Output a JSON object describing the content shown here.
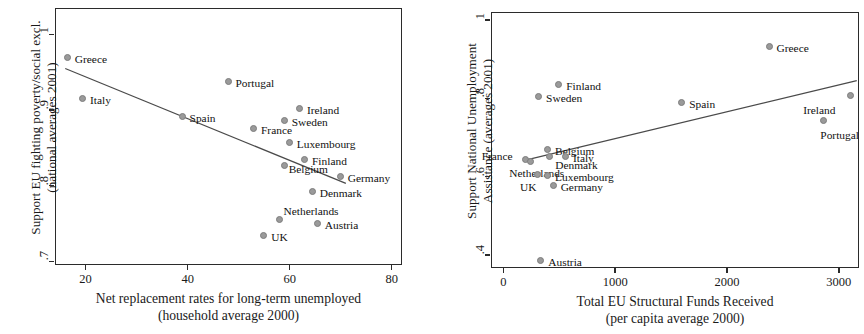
{
  "chart_data": [
    {
      "type": "scatter",
      "panel": "left",
      "title": "",
      "xlabel": "Net replacement rates for long-term unemployed",
      "xlabel2": "(household average 2000)",
      "ylabel": "Support EU fighting poverty/social excl.",
      "ylabel2": "(national averages 2001)",
      "xlim": [
        14,
        82
      ],
      "ylim": [
        0.695,
        1.035
      ],
      "xticks": [
        20,
        40,
        60,
        80
      ],
      "xticklabels": [
        "20",
        "40",
        "60",
        "80"
      ],
      "yticks": [
        0.7,
        0.8,
        0.9,
        1.0
      ],
      "yticklabels": [
        ".7",
        ".8",
        ".9",
        "1"
      ],
      "grid": false,
      "legend": "none",
      "point_labels_shown": true,
      "points": [
        {
          "label": "Greece",
          "x": 16.5,
          "y": 0.969,
          "lx": 7,
          "ly": -4
        },
        {
          "label": "Italy",
          "x": 19.5,
          "y": 0.915,
          "lx": 7,
          "ly": -4
        },
        {
          "label": "Spain",
          "x": 39.0,
          "y": 0.891,
          "lx": 7,
          "ly": -4
        },
        {
          "label": "Portugal",
          "x": 48.0,
          "y": 0.937,
          "lx": 7,
          "ly": -4
        },
        {
          "label": "France",
          "x": 53.0,
          "y": 0.875,
          "lx": 7,
          "ly": -4
        },
        {
          "label": "UK",
          "x": 55.0,
          "y": 0.733,
          "lx": 7,
          "ly": -4
        },
        {
          "label": "Netherlands",
          "x": 58.0,
          "y": 0.755,
          "lx": 4,
          "ly": -14
        },
        {
          "label": "Sweden",
          "x": 59.0,
          "y": 0.885,
          "lx": 7,
          "ly": -4
        },
        {
          "label": "Belgium",
          "x": 59.0,
          "y": 0.826,
          "lx": 4,
          "ly": -2
        },
        {
          "label": "Luxembourg",
          "x": 60.0,
          "y": 0.857,
          "lx": 7,
          "ly": -4
        },
        {
          "label": "Ireland",
          "x": 62.0,
          "y": 0.902,
          "lx": 7,
          "ly": -4
        },
        {
          "label": "Finland",
          "x": 63.0,
          "y": 0.834,
          "lx": 7,
          "ly": -4
        },
        {
          "label": "Denmark",
          "x": 64.5,
          "y": 0.792,
          "lx": 7,
          "ly": -4
        },
        {
          "label": "Austria",
          "x": 65.5,
          "y": 0.749,
          "lx": 7,
          "ly": -4
        },
        {
          "label": "Germany",
          "x": 70.0,
          "y": 0.812,
          "lx": 7,
          "ly": -4
        }
      ],
      "fit_line": {
        "x1": 16.0,
        "y1": 0.955,
        "x2": 71.0,
        "y2": 0.803
      }
    },
    {
      "type": "scatter",
      "panel": "right",
      "title": "",
      "xlabel": "Total EU Structural Funds Received",
      "xlabel2": "(per capita average 2000)",
      "ylabel": "Support National Unemployment",
      "ylabel2": "Assistance (averages 2001)",
      "xlim": [
        -110,
        3180
      ],
      "ylim": [
        0.367,
        1.02
      ],
      "xticks": [
        0,
        1000,
        2000,
        3000
      ],
      "xticklabels": [
        "0",
        "1000",
        "2000",
        "3000"
      ],
      "yticks": [
        0.4,
        0.6,
        0.8,
        1.0
      ],
      "yticklabels": [
        ".4",
        ".6",
        ".8",
        "1"
      ],
      "grid": false,
      "legend": "none",
      "point_labels_shown": true,
      "points": [
        {
          "label": "France",
          "x": 200,
          "y": 0.643,
          "lx": -44,
          "ly": -9
        },
        {
          "label": "Netherlands",
          "x": 250,
          "y": 0.637,
          "lx": -22,
          "ly": 6
        },
        {
          "label": "Sweden",
          "x": 320,
          "y": 0.803,
          "lx": 7,
          "ly": -4
        },
        {
          "label": "UK",
          "x": 310,
          "y": 0.604,
          "lx": -18,
          "ly": 7
        },
        {
          "label": "Austria",
          "x": 340,
          "y": 0.384,
          "lx": 7,
          "ly": -4
        },
        {
          "label": "Belgium",
          "x": 400,
          "y": 0.668,
          "lx": 7,
          "ly": -4
        },
        {
          "label": "Luxembourg",
          "x": 400,
          "y": 0.602,
          "lx": 7,
          "ly": -4
        },
        {
          "label": "Denmark",
          "x": 420,
          "y": 0.651,
          "lx": 5,
          "ly": 3
        },
        {
          "label": "Germany",
          "x": 450,
          "y": 0.577,
          "lx": 7,
          "ly": -4
        },
        {
          "label": "Finland",
          "x": 500,
          "y": 0.835,
          "lx": 7,
          "ly": -4
        },
        {
          "label": "Italy",
          "x": 560,
          "y": 0.65,
          "lx": 7,
          "ly": -4
        },
        {
          "label": "Spain",
          "x": 1600,
          "y": 0.787,
          "lx": 7,
          "ly": -4
        },
        {
          "label": "Greece",
          "x": 2380,
          "y": 0.93,
          "lx": 7,
          "ly": -4
        },
        {
          "label": "Portugal",
          "x": 2870,
          "y": 0.742,
          "lx": -4,
          "ly": 9
        },
        {
          "label": "Ireland",
          "x": 3110,
          "y": 0.806,
          "lx": -48,
          "ly": 9
        }
      ],
      "fit_line": {
        "x1": 180,
        "y1": 0.641,
        "x2": 3160,
        "y2": 0.845
      }
    }
  ],
  "left": {
    "ylabel_line1": "Support EU fighting poverty/social excl.",
    "ylabel_line2": "(national averages 2001)",
    "xlabel_line1": "Net replacement rates for long-term unemployed",
    "xlabel_line2": "(household average 2000)"
  },
  "right": {
    "ylabel_line1": "Support National Unemployment",
    "ylabel_line2": "Assistance (averages 2001)",
    "xlabel_line1": "Total EU Structural Funds Received",
    "xlabel_line2": "(per capita average 2000)"
  },
  "colors": {
    "marker_fill": "#9a9a9a",
    "marker_stroke": "#7d7d7d",
    "axis": "#2b2b2b",
    "fit_line": "#4a4a4a",
    "text": "#111111",
    "background": "#ffffff"
  }
}
